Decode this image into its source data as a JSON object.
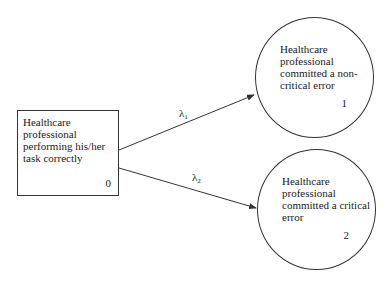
{
  "diagram": {
    "type": "state-transition",
    "states": [
      {
        "id": "0",
        "label": "Healthcare professional performing his/her task correctly",
        "number": "0",
        "shape": "rectangle"
      },
      {
        "id": "1",
        "label": "Healthcare professional committed a non-critical error",
        "number": "1",
        "shape": "circle"
      },
      {
        "id": "2",
        "label": "Healthcare professional committed a critical error",
        "number": "2",
        "shape": "circle"
      }
    ],
    "transitions": [
      {
        "from": "0",
        "to": "1",
        "symbol": "λ",
        "subscript": "1"
      },
      {
        "from": "0",
        "to": "2",
        "symbol": "λ",
        "subscript": "2"
      }
    ]
  },
  "colors": {
    "stroke": "#333333",
    "background": "#ffffff",
    "text": "#1a1a1a"
  }
}
